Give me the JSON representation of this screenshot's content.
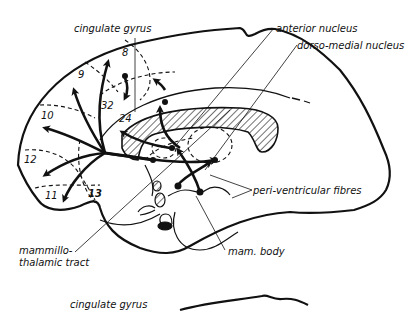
{
  "diagram": {
    "type": "anatomical-sagittal-brain-section",
    "colors": {
      "ink": "#111111",
      "background": "#ffffff"
    },
    "labels": {
      "cingulate_gyrus": "cingulate gyrus",
      "anterior_nucleus": "anterior nucleus",
      "dorso_medial_nucleus": "dorso-medial nucleus",
      "peri_ventricular_fibres": "peri-ventricular fibres",
      "mam_body": "mam. body",
      "mammillo_thalamic_tract_line1": "mammillo-",
      "mammillo_thalamic_tract_line2": "thalamic tract",
      "cingulate_gyrus_lower": "cingulate gyrus"
    },
    "areas": [
      {
        "id": "8",
        "label": "8"
      },
      {
        "id": "9",
        "label": "9"
      },
      {
        "id": "32",
        "label": "32"
      },
      {
        "id": "24",
        "label": "24"
      },
      {
        "id": "10",
        "label": "10"
      },
      {
        "id": "12",
        "label": "12"
      },
      {
        "id": "11",
        "label": "11"
      },
      {
        "id": "13",
        "label": "13"
      }
    ]
  }
}
